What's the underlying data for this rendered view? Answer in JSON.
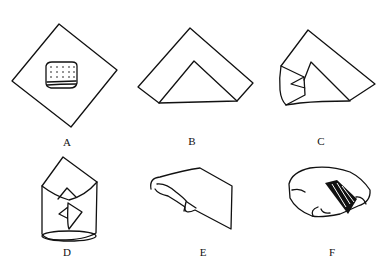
{
  "figure": {
    "colors": {
      "line": "#111111",
      "background": "#ffffff"
    },
    "panels": [
      {
        "id": "A",
        "label": "A",
        "content": "Square sheet rotated as a diamond with a dotted pad placed in the center"
      },
      {
        "id": "B",
        "label": "B",
        "content": "Bottom corner folded up forming an inner triangle"
      },
      {
        "id": "C",
        "label": "C",
        "content": "Left side folded inward over the triangle"
      },
      {
        "id": "D",
        "label": "D",
        "content": "Both sides folded into an envelope-like cylinder"
      },
      {
        "id": "E",
        "label": "E",
        "content": "Pack rolled and top flap folded down"
      },
      {
        "id": "F",
        "label": "F",
        "content": "Finished package with a hatched band / tape"
      }
    ]
  }
}
